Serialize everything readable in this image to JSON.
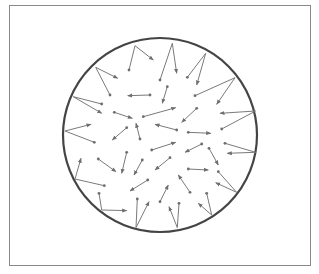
{
  "figure": {
    "frame": {
      "x": 9,
      "y": 5,
      "width": 301,
      "height": 260,
      "stroke": "#8a8a8a"
    },
    "container": {
      "cx": 160,
      "cy": 135,
      "r": 97,
      "stroke": "#444444",
      "stroke_width": 2.2
    },
    "arrow_color": "#7a7a7a",
    "dot_color": "#6e6e6e",
    "molecules": [
      {
        "path": [
          [
            222,
            105
          ],
          [
            240,
            32
          ],
          [
            295,
            75
          ]
        ]
      },
      {
        "path": [
          [
            315,
            135
          ],
          [
            352,
            25
          ],
          [
            365,
            115
          ]
        ]
      },
      {
        "path": [
          [
            397,
            127
          ],
          [
            452,
            55
          ],
          [
            425,
            150
          ]
        ]
      },
      {
        "path": [
          [
            165,
            180
          ],
          [
            122,
            97
          ],
          [
            188,
            130
          ]
        ]
      },
      {
        "path": [
          [
            285,
            180
          ],
          [
            218,
            182
          ]
        ]
      },
      {
        "path": [
          [
            337,
            155
          ],
          [
            322,
            205
          ]
        ]
      },
      {
        "path": [
          [
            420,
            182
          ],
          [
            540,
            128
          ],
          [
            485,
            208
          ]
        ]
      },
      {
        "path": [
          [
            140,
            207
          ],
          [
            55,
            185
          ],
          [
            140,
            235
          ]
        ]
      },
      {
        "path": [
          [
            178,
            232
          ],
          [
            232,
            250
          ]
        ]
      },
      {
        "path": [
          [
            265,
            245
          ],
          [
            362,
            218
          ]
        ]
      },
      {
        "path": [
          [
            425,
            220
          ],
          [
            380,
            262
          ]
        ]
      },
      {
        "path": [
          [
            500,
            282
          ],
          [
            602,
            228
          ],
          [
            495,
            235
          ]
        ]
      },
      {
        "path": [
          [
            118,
            322
          ],
          [
            30,
            288
          ],
          [
            108,
            268
          ]
        ]
      },
      {
        "path": [
          [
            215,
            278
          ],
          [
            172,
            315
          ]
        ]
      },
      {
        "path": [
          [
            255,
            312
          ],
          [
            243,
            265
          ]
        ]
      },
      {
        "path": [
          [
            365,
            285
          ],
          [
            300,
            268
          ]
        ]
      },
      {
        "path": [
          [
            400,
            292
          ],
          [
            467,
            295
          ]
        ]
      },
      {
        "path": [
          [
            290,
            345
          ],
          [
            362,
            322
          ]
        ]
      },
      {
        "path": [
          [
            440,
            327
          ],
          [
            390,
            352
          ]
        ]
      },
      {
        "path": [
          [
            510,
            325
          ],
          [
            602,
            352
          ],
          [
            517,
            355
          ]
        ]
      },
      {
        "path": [
          [
            130,
            372
          ],
          [
            183,
            410
          ]
        ]
      },
      {
        "path": [
          [
            215,
            352
          ],
          [
            200,
            415
          ]
        ]
      },
      {
        "path": [
          [
            262,
            375
          ],
          [
            237,
            420
          ]
        ]
      },
      {
        "path": [
          [
            345,
            368
          ],
          [
            300,
            405
          ]
        ]
      },
      {
        "path": [
          [
            462,
            340
          ],
          [
            490,
            390
          ]
        ]
      },
      {
        "path": [
          [
            148,
            452
          ],
          [
            60,
            432
          ],
          [
            78,
            370
          ]
        ]
      },
      {
        "path": [
          [
            278,
            435
          ],
          [
            225,
            468
          ]
        ]
      },
      {
        "path": [
          [
            400,
            402
          ],
          [
            460,
            405
          ]
        ]
      },
      {
        "path": [
          [
            490,
            410
          ],
          [
            545,
            472
          ],
          [
            482,
            443
          ]
        ]
      },
      {
        "path": [
          [
            132,
            475
          ],
          [
            140,
            525
          ],
          [
            215,
            527
          ]
        ]
      },
      {
        "path": [
          [
            247,
            492
          ],
          [
            243,
            578
          ],
          [
            282,
            500
          ]
        ]
      },
      {
        "path": [
          [
            315,
            500
          ],
          [
            340,
            450
          ]
        ]
      },
      {
        "path": [
          [
            405,
            472
          ],
          [
            370,
            420
          ]
        ]
      },
      {
        "path": [
          [
            372,
            505
          ],
          [
            367,
            578
          ],
          [
            342,
            515
          ]
        ]
      },
      {
        "path": [
          [
            455,
            475
          ],
          [
            470,
            540
          ],
          [
            430,
            505
          ]
        ]
      }
    ],
    "path_coordinate_transform": {
      "offset_x": 55,
      "offset_y": 35,
      "scale": 0.3333
    }
  }
}
